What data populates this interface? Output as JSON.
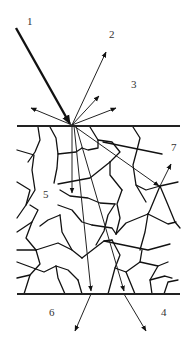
{
  "diagram": {
    "labels": [
      {
        "id": "incident",
        "text": "1"
      },
      {
        "id": "specular-reflection",
        "text": "2"
      },
      {
        "id": "diffuse-reflection",
        "text": "3"
      },
      {
        "id": "transmitted-direct",
        "text": "4"
      },
      {
        "id": "refracted-internal",
        "text": "5"
      },
      {
        "id": "transmitted-scattered",
        "text": "6"
      },
      {
        "id": "grain-boundary-scatter",
        "text": "7"
      }
    ],
    "colors": {
      "line": "#111111",
      "background": "#ffffff",
      "label": "#333333"
    }
  }
}
